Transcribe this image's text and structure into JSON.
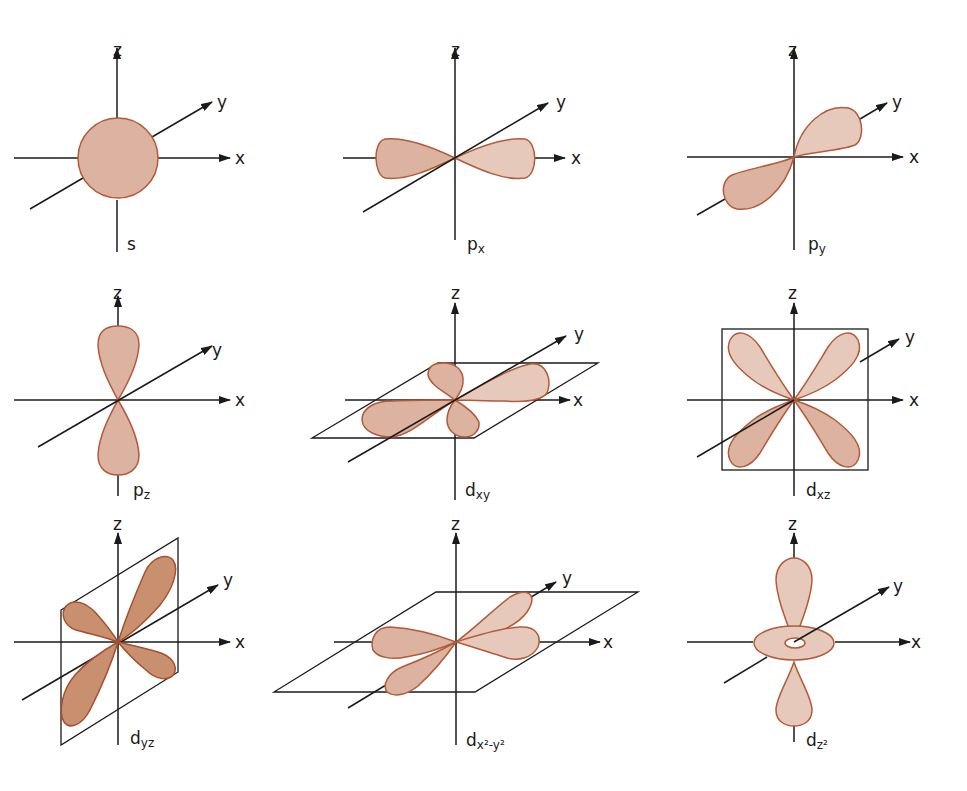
{
  "figure": {
    "title": "",
    "colors": {
      "lobe_fill": "#dcb2a0",
      "lobe_fill_light": "#e6c4b4",
      "lobe_fill_dark": "#c98e74",
      "lobe_stroke": "#b25a3a",
      "axis": "#1a1a1a",
      "background": "#ffffff"
    },
    "axis_labels": {
      "x": "x",
      "y": "y",
      "z": "z"
    },
    "panels": [
      {
        "id": "s",
        "label_main": "s",
        "label_sub": "",
        "label_sup": "",
        "shape": "sphere"
      },
      {
        "id": "px",
        "label_main": "p",
        "label_sub": "x",
        "shape": "dumbbell-x"
      },
      {
        "id": "py",
        "label_main": "p",
        "label_sub": "y",
        "shape": "dumbbell-y"
      },
      {
        "id": "pz",
        "label_main": "p",
        "label_sub": "z",
        "shape": "dumbbell-z"
      },
      {
        "id": "dxy",
        "label_main": "d",
        "label_sub": "xy",
        "shape": "cloverleaf-xy-plane"
      },
      {
        "id": "dxz",
        "label_main": "d",
        "label_sub": "xz",
        "shape": "cloverleaf-xz-plane"
      },
      {
        "id": "dyz",
        "label_main": "d",
        "label_sub": "yz",
        "shape": "cloverleaf-yz-plane"
      },
      {
        "id": "dx2y2",
        "label_main": "d",
        "label_sub": "x²-y²",
        "shape": "cloverleaf-on-axes-xy-plane"
      },
      {
        "id": "dz2",
        "label_main": "d",
        "label_sub": "z²",
        "shape": "dumbbell-z-with-torus"
      }
    ]
  }
}
